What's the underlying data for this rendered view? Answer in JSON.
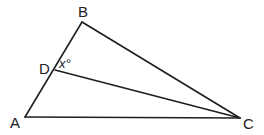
{
  "diagram": {
    "type": "triangle",
    "stroke_color": "#1e1e1e",
    "points": {
      "A": {
        "label": "A",
        "x": 25,
        "y": 117,
        "lx": 10,
        "ly": 128
      },
      "B": {
        "label": "B",
        "x": 82,
        "y": 22,
        "lx": 78,
        "ly": 17
      },
      "C": {
        "label": "C",
        "x": 240,
        "y": 118,
        "lx": 243,
        "ly": 129
      },
      "D": {
        "label": "D",
        "x": 55,
        "y": 70,
        "lx": 39,
        "ly": 74
      }
    },
    "segments": [
      {
        "name": "segment-ab",
        "from": "A",
        "to": "B"
      },
      {
        "name": "segment-bc",
        "from": "B",
        "to": "C"
      },
      {
        "name": "segment-ac",
        "from": "A",
        "to": "C"
      },
      {
        "name": "segment-dc",
        "from": "D",
        "to": "C"
      }
    ],
    "angle_label": {
      "text": "x°",
      "x": 59,
      "y": 68
    }
  }
}
